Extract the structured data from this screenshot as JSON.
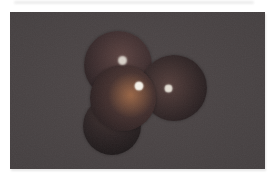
{
  "page": {
    "background": "#ffffff"
  },
  "photo": {
    "description": "photograph of a space-filling molecular model, four dark red spheres in tetrahedral cluster",
    "left": 10,
    "top": 12,
    "width": 255,
    "height": 157,
    "background_center": "#4e4748",
    "background_edge": "#443f40",
    "grain_opacity": 0.06
  },
  "molecule": {
    "sphere_color_family": "dark maroon red",
    "spheres": [
      {
        "id": "sphere-top-left",
        "cx": 108,
        "cy": 53,
        "r": 34,
        "light_x": 56,
        "light_y": 38,
        "c_light": "#5c4341",
        "c_mid": "#3e2e2f",
        "c_edge": "#221b1d"
      },
      {
        "id": "sphere-right",
        "cx": 164,
        "cy": 76,
        "r": 33,
        "light_x": 42,
        "light_y": 46,
        "c_light": "#553f3c",
        "c_mid": "#372a2a",
        "c_edge": "#1e181a"
      },
      {
        "id": "sphere-bottom-left",
        "cx": 102,
        "cy": 114,
        "r": 29,
        "light_x": 46,
        "light_y": 26,
        "c_light": "#443432",
        "c_mid": "#2c2324",
        "c_edge": "#1a1617"
      },
      {
        "id": "sphere-center-front",
        "cx": 113,
        "cy": 86,
        "r": 33,
        "light_x": 62,
        "light_y": 42,
        "c_light": "#5c4038",
        "c_mid": "#3f2d2c",
        "c_edge": "#221b1d",
        "glow": {
          "x": 62,
          "y": 46,
          "color": "rgba(214,138,82,0.50)",
          "spread": 42
        }
      }
    ],
    "highlights": [
      {
        "sphere": "sphere-top-left",
        "x": 112,
        "y": 48,
        "size": 5,
        "color": "#e6e1d8",
        "blur": 2,
        "opacity": 0.9
      },
      {
        "sphere": "sphere-center-front",
        "x": 129,
        "y": 74,
        "size": 6,
        "color": "#f6f2e9",
        "blur": 1.5,
        "opacity": 1
      },
      {
        "sphere": "sphere-right",
        "x": 158,
        "y": 76,
        "size": 5,
        "color": "#ece7dd",
        "blur": 1.5,
        "opacity": 0.95
      }
    ]
  }
}
